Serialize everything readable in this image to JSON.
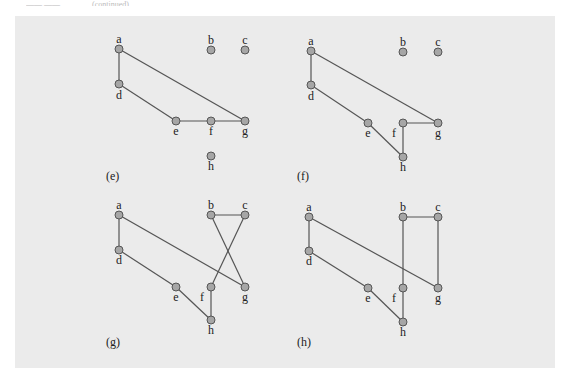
{
  "header": {
    "left": "—— ——",
    "right": "(continued)"
  },
  "figure": {
    "background": "#ebebeb",
    "node_fill": "#a6a6a6",
    "edge_color": "#555555",
    "subfigures": [
      {
        "caption": "(e)",
        "caption_pos": [
          106,
          180
        ],
        "nodes": {
          "a": {
            "x": 119,
            "y": 49,
            "lx": 119,
            "ly": 43
          },
          "b": {
            "x": 211,
            "y": 50,
            "lx": 211,
            "ly": 44
          },
          "c": {
            "x": 245,
            "y": 50,
            "lx": 245,
            "ly": 44
          },
          "d": {
            "x": 119,
            "y": 84,
            "lx": 119,
            "ly": 99
          },
          "e": {
            "x": 176,
            "y": 121,
            "lx": 176,
            "ly": 135
          },
          "f": {
            "x": 211,
            "y": 121,
            "lx": 211,
            "ly": 135
          },
          "g": {
            "x": 245,
            "y": 121,
            "lx": 245,
            "ly": 135
          },
          "h": {
            "x": 211,
            "y": 156,
            "lx": 211,
            "ly": 170
          }
        },
        "edges": [
          [
            "a",
            "d"
          ],
          [
            "a",
            "g"
          ],
          [
            "d",
            "e"
          ],
          [
            "e",
            "f"
          ],
          [
            "f",
            "g"
          ]
        ]
      },
      {
        "caption": "(f)",
        "caption_pos": [
          297,
          180
        ],
        "nodes": {
          "a": {
            "x": 311,
            "y": 51,
            "lx": 311,
            "ly": 45
          },
          "b": {
            "x": 403,
            "y": 52,
            "lx": 403,
            "ly": 46
          },
          "c": {
            "x": 438,
            "y": 52,
            "lx": 438,
            "ly": 46
          },
          "d": {
            "x": 311,
            "y": 85,
            "lx": 311,
            "ly": 100
          },
          "e": {
            "x": 368,
            "y": 123,
            "lx": 368,
            "ly": 137
          },
          "f": {
            "x": 403,
            "y": 123,
            "lx": 394,
            "ly": 137
          },
          "g": {
            "x": 438,
            "y": 123,
            "lx": 438,
            "ly": 137
          },
          "h": {
            "x": 403,
            "y": 157,
            "lx": 403,
            "ly": 171
          }
        },
        "edges": [
          [
            "a",
            "d"
          ],
          [
            "a",
            "g"
          ],
          [
            "d",
            "e"
          ],
          [
            "e",
            "h"
          ],
          [
            "h",
            "f"
          ],
          [
            "f",
            "g"
          ]
        ]
      },
      {
        "caption": "(g)",
        "caption_pos": [
          106,
          346
        ],
        "nodes": {
          "a": {
            "x": 119,
            "y": 215,
            "lx": 119,
            "ly": 209
          },
          "b": {
            "x": 211,
            "y": 215,
            "lx": 211,
            "ly": 209
          },
          "c": {
            "x": 245,
            "y": 215,
            "lx": 245,
            "ly": 209
          },
          "d": {
            "x": 119,
            "y": 250,
            "lx": 119,
            "ly": 264
          },
          "e": {
            "x": 176,
            "y": 287,
            "lx": 176,
            "ly": 301
          },
          "f": {
            "x": 211,
            "y": 287,
            "lx": 202,
            "ly": 301
          },
          "g": {
            "x": 245,
            "y": 287,
            "lx": 245,
            "ly": 301
          },
          "h": {
            "x": 211,
            "y": 320,
            "lx": 211,
            "ly": 334
          }
        },
        "edges": [
          [
            "a",
            "d"
          ],
          [
            "a",
            "g"
          ],
          [
            "d",
            "e"
          ],
          [
            "e",
            "h"
          ],
          [
            "h",
            "f"
          ],
          [
            "f",
            "c"
          ],
          [
            "c",
            "b"
          ],
          [
            "b",
            "g"
          ]
        ]
      },
      {
        "caption": "(h)",
        "caption_pos": [
          297,
          346
        ],
        "nodes": {
          "a": {
            "x": 309,
            "y": 217,
            "lx": 309,
            "ly": 211
          },
          "b": {
            "x": 403,
            "y": 217,
            "lx": 403,
            "ly": 211
          },
          "c": {
            "x": 438,
            "y": 217,
            "lx": 438,
            "ly": 211
          },
          "d": {
            "x": 309,
            "y": 251,
            "lx": 309,
            "ly": 265
          },
          "e": {
            "x": 368,
            "y": 288,
            "lx": 368,
            "ly": 302
          },
          "f": {
            "x": 403,
            "y": 288,
            "lx": 394,
            "ly": 302
          },
          "g": {
            "x": 438,
            "y": 288,
            "lx": 438,
            "ly": 302
          },
          "h": {
            "x": 403,
            "y": 322,
            "lx": 403,
            "ly": 336
          }
        },
        "edges": [
          [
            "a",
            "d"
          ],
          [
            "a",
            "g"
          ],
          [
            "d",
            "e"
          ],
          [
            "e",
            "h"
          ],
          [
            "h",
            "f"
          ],
          [
            "f",
            "b"
          ],
          [
            "b",
            "c"
          ],
          [
            "c",
            "g"
          ]
        ]
      }
    ]
  }
}
